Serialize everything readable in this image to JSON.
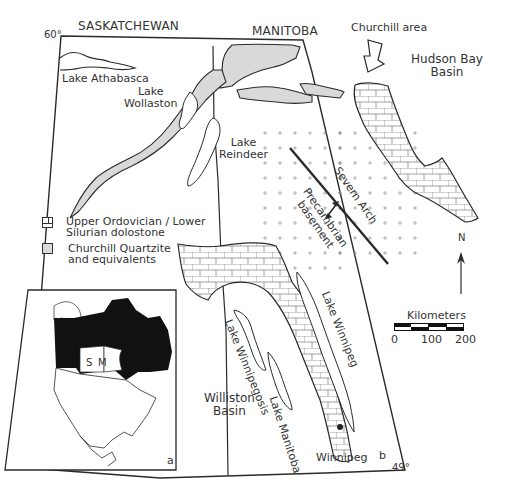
{
  "map": {
    "provinces": [
      "SASKATCHEWAN",
      "MANITOBA"
    ],
    "latitudes": {
      "north": "60°",
      "south": "49°"
    },
    "lakes": {
      "athabasca": "Lake Athabasca",
      "wollaston": [
        "Lake",
        "Wollaston"
      ],
      "reindeer": [
        "Lake",
        "Reindeer"
      ],
      "winnipeg": "Lake Winnipeg",
      "winnipegosis": "Lake Winnipegosis",
      "manitoba": "Lake Manitoba"
    },
    "places": {
      "churchill_area": "Churchill area",
      "hudson_bay_basin": [
        "Hudson Bay",
        "Basin"
      ],
      "williston_basin": [
        "Williston",
        "Basin"
      ],
      "winnipeg": "Winnipeg"
    },
    "features": {
      "severn_arch": "Severn Arch",
      "precambrian": [
        "Precambrian",
        "basement"
      ]
    },
    "panel_labels": {
      "inset": "a",
      "main": "b"
    },
    "inset": {
      "saskatchewan_abbr": "S",
      "manitoba_abbr": "M"
    }
  },
  "legend": {
    "items": [
      {
        "pattern": "brick",
        "label": [
          "Upper Ordovician / Lower",
          "Silurian dolostone"
        ]
      },
      {
        "pattern": "grey",
        "label": [
          "Churchill Quartzite",
          "and equivalents"
        ],
        "color": "#d9d9d9"
      }
    ]
  },
  "north_arrow": {
    "label": "N"
  },
  "scale_bar": {
    "title": "Kilometers",
    "ticks": [
      "0",
      "100",
      "200"
    ]
  },
  "colors": {
    "quartzite": "#d9d9d9",
    "line": "#2a2a2a",
    "canada_fill": "#111111"
  }
}
